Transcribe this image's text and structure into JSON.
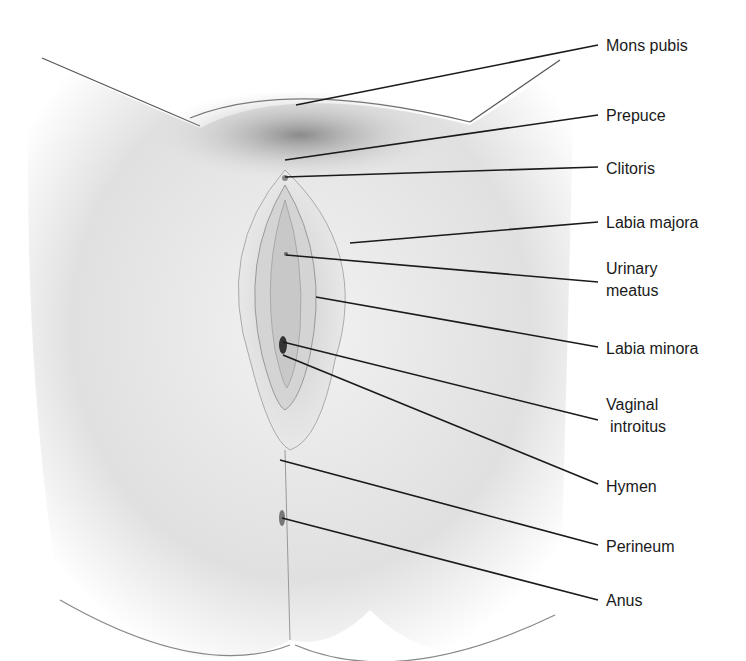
{
  "figure": {
    "type": "anatomical illustration (grayscale)",
    "colors": {
      "background": "#ffffff",
      "skin_light": "#e6e6e6",
      "skin_shadow": "#bdbdbd",
      "leader_line": "#1a1a1a",
      "text": "#1a1a1a"
    }
  },
  "labels": [
    {
      "id": "mons-pubis",
      "text": "Mons pubis",
      "x": 606,
      "y": 35,
      "line": [
        [
          296,
          105
        ],
        [
          598,
          45
        ]
      ]
    },
    {
      "id": "prepuce",
      "text": "Prepuce",
      "x": 606,
      "y": 105,
      "line": [
        [
          285,
          160
        ],
        [
          598,
          115
        ]
      ]
    },
    {
      "id": "clitoris",
      "text": "Clitoris",
      "x": 606,
      "y": 158,
      "line": [
        [
          285,
          177
        ],
        [
          598,
          167
        ]
      ]
    },
    {
      "id": "labia-majora",
      "text": "Labia majora",
      "x": 606,
      "y": 212,
      "line": [
        [
          350,
          243
        ],
        [
          598,
          222
        ]
      ]
    },
    {
      "id": "urinary-meatus",
      "text": "Urinary",
      "text2": "meatus",
      "x": 606,
      "y": 258,
      "line": [
        [
          286,
          255
        ],
        [
          598,
          282
        ]
      ]
    },
    {
      "id": "labia-minora",
      "text": "Labia minora",
      "x": 606,
      "y": 338,
      "line": [
        [
          316,
          297
        ],
        [
          598,
          347
        ]
      ]
    },
    {
      "id": "vaginal-introitus",
      "text": "Vaginal",
      "text2": "introitus",
      "x": 606,
      "y": 394,
      "line": [
        [
          283,
          342
        ],
        [
          598,
          420
        ]
      ]
    },
    {
      "id": "hymen",
      "text": "Hymen",
      "x": 606,
      "y": 476,
      "line": [
        [
          283,
          355
        ],
        [
          598,
          484
        ]
      ]
    },
    {
      "id": "perineum",
      "text": "Perineum",
      "x": 606,
      "y": 536,
      "line": [
        [
          280,
          460
        ],
        [
          598,
          545
        ]
      ]
    },
    {
      "id": "anus",
      "text": "Anus",
      "x": 606,
      "y": 590,
      "line": [
        [
          282,
          518
        ],
        [
          598,
          600
        ]
      ]
    }
  ]
}
